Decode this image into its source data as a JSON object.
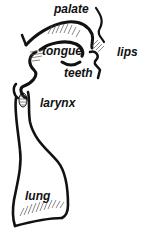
{
  "diagram": {
    "labels": {
      "palate": "palate",
      "tongue": "tongue",
      "lips": "lips",
      "teeth": "teeth",
      "larynx": "larynx",
      "lung": "lung"
    },
    "colors": {
      "outline": "#111111",
      "hatch": "#555555",
      "background": "#ffffff"
    }
  }
}
